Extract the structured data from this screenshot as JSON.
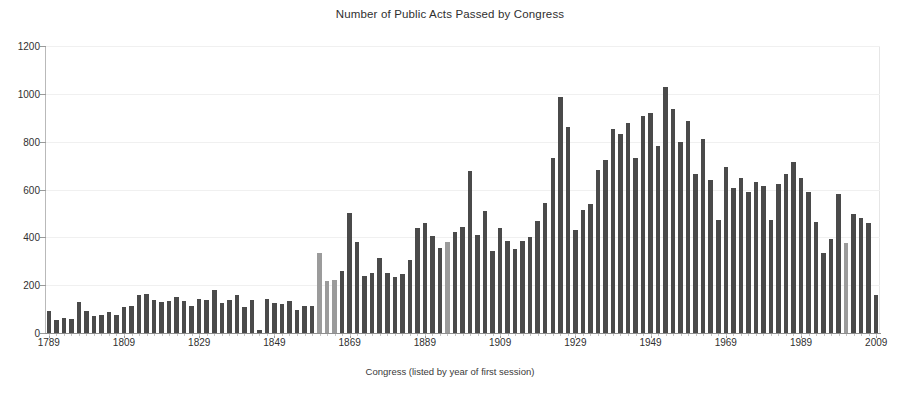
{
  "chart_data": {
    "type": "bar",
    "title": "Number of Public Acts Passed by Congress",
    "xlabel": "Congress (listed by year of first session)",
    "ylabel": "",
    "ylim": [
      0,
      1200
    ],
    "ytick_labels": [
      "0",
      "200",
      "400",
      "600",
      "800",
      "1000",
      "1200"
    ],
    "ytick_values": [
      0,
      200,
      400,
      600,
      800,
      1000,
      1200
    ],
    "xtick_labels": [
      "1789",
      "1809",
      "1829",
      "1849",
      "1869",
      "1889",
      "1909",
      "1929",
      "1949",
      "1969",
      "1989",
      "2009"
    ],
    "xtick_values": [
      1789,
      1809,
      1829,
      1849,
      1869,
      1889,
      1909,
      1929,
      1949,
      1969,
      1989,
      2009
    ],
    "grid": false,
    "legend": "none",
    "bar_color": "#4a4a4a",
    "highlight_color": "#9b9b9b",
    "x_start_year": 1789,
    "x_step_years": 2,
    "categories": [
      1789,
      1791,
      1793,
      1795,
      1797,
      1799,
      1801,
      1803,
      1805,
      1807,
      1809,
      1811,
      1813,
      1815,
      1817,
      1819,
      1821,
      1823,
      1825,
      1827,
      1829,
      1831,
      1833,
      1835,
      1837,
      1839,
      1841,
      1843,
      1845,
      1847,
      1849,
      1851,
      1853,
      1855,
      1857,
      1859,
      1861,
      1863,
      1865,
      1867,
      1869,
      1871,
      1873,
      1875,
      1877,
      1879,
      1881,
      1883,
      1885,
      1887,
      1889,
      1891,
      1893,
      1895,
      1897,
      1899,
      1901,
      1903,
      1905,
      1907,
      1909,
      1911,
      1913,
      1915,
      1917,
      1919,
      1921,
      1923,
      1925,
      1927,
      1929,
      1931,
      1933,
      1935,
      1937,
      1939,
      1941,
      1943,
      1945,
      1947,
      1949,
      1951,
      1953,
      1955,
      1957,
      1959,
      1961,
      1963,
      1965,
      1967,
      1969,
      1971,
      1973,
      1975,
      1977,
      1979,
      1981,
      1983,
      1985,
      1987,
      1989,
      1991,
      1993,
      1995,
      1997,
      1999,
      2001,
      2003,
      2005,
      2007,
      2009
    ],
    "values": [
      94,
      54,
      63,
      60,
      129,
      94,
      72,
      77,
      87,
      75,
      109,
      115,
      158,
      165,
      136,
      129,
      133,
      151,
      134,
      115,
      141,
      136,
      178,
      127,
      137,
      160,
      110,
      139,
      11,
      143,
      124,
      122,
      132,
      95,
      111,
      113,
      334,
      218,
      220,
      258,
      500,
      380,
      239,
      252,
      315,
      250,
      236,
      245,
      306,
      440,
      459,
      405,
      354,
      380,
      422,
      442,
      678,
      411,
      512,
      341,
      438,
      386,
      350,
      384,
      401,
      470,
      544,
      732,
      987,
      861,
      431,
      516,
      539,
      682,
      724,
      852,
      834,
      880,
      733,
      906,
      921,
      781,
      1028,
      936,
      800,
      885,
      666,
      810,
      640,
      473,
      695,
      607,
      649,
      588,
      633,
      613,
      473,
      623,
      664,
      713,
      650,
      590,
      465,
      333,
      394,
      580,
      377,
      498,
      482,
      460,
      160
    ],
    "highlighted_indices": [
      36,
      37,
      38,
      53,
      106
    ],
    "peak": {
      "year": 1953,
      "value": 1028
    }
  },
  "axes": {
    "y_axis_name": "y-axis",
    "x_axis_name": "x-axis"
  }
}
